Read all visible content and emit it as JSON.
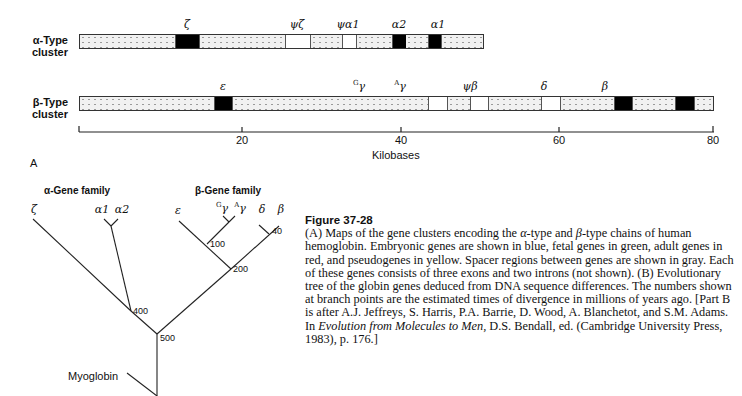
{
  "panel_a": {
    "label": "A",
    "alpha_cluster": {
      "label_line1": "α-Type",
      "label_line2": "cluster",
      "genes": [
        {
          "name": "ζ",
          "type": "gene",
          "x": 188
        },
        {
          "name": "ψζ",
          "type": "pseudogene",
          "x": 296
        },
        {
          "name": "ψα1",
          "type": "pseudogene",
          "x": 349
        },
        {
          "name": "α2",
          "type": "gene",
          "x": 399
        },
        {
          "name": "α1",
          "type": "gene",
          "x": 438
        }
      ]
    },
    "beta_cluster": {
      "label_line1": "β-Type",
      "label_line2": "cluster",
      "genes": [
        {
          "name": "ε",
          "type": "gene",
          "x": 223
        },
        {
          "name": "Gγ",
          "sup": "G",
          "base": "γ",
          "type": "fetal",
          "x": 358
        },
        {
          "name": "Aγ",
          "sup": "A",
          "base": "γ",
          "type": "fetal",
          "x": 400
        },
        {
          "name": "ψβ",
          "type": "pseudogene",
          "x": 470
        },
        {
          "name": "δ",
          "type": "gene",
          "x": 543
        },
        {
          "name": "β",
          "type": "gene",
          "x": 605
        }
      ]
    },
    "axis": {
      "title": "Kilobases",
      "ticks": [
        "20",
        "40",
        "60",
        "80"
      ],
      "range": [
        0,
        80
      ]
    }
  },
  "panel_b": {
    "alpha_family_title": "α-Gene family",
    "beta_family_title": "β-Gene family",
    "leaves": {
      "zeta": "ζ",
      "alpha1": "α1",
      "alpha2": "α2",
      "epsilon": "ε",
      "g_gamma_sup": "G",
      "a_gamma_sup": "A",
      "gamma": "γ",
      "delta": "δ",
      "beta": "β",
      "myoglobin": "Myoglobin"
    },
    "nodes": {
      "n100": "100",
      "n40": "40",
      "n200": "200",
      "n400": "400",
      "n500": "500"
    }
  },
  "caption": {
    "title": "Figure 37-28",
    "part1": "(A) Maps of the gene clusters encoding the ",
    "alpha": "α",
    "part2": "-type and ",
    "beta": "β",
    "part3": "-type chains of human hemoglobin. Embryonic genes are shown in blue, fetal genes in green, adult genes in red, and pseudogenes in yellow. Spacer regions between genes are shown in gray. Each of these genes consists of three exons and two introns (not shown). (B) Evolutionary tree of the globin genes deduced from DNA sequence differences. The numbers shown at branch points are the estimated times of divergence in millions of years ago. [Part B is after A.J. Jeffreys, S. Harris, P.A. Barrie, D. Wood, A. Blanchetot, and S.M. Adams. In ",
    "book": "Evolution from Molecules to Men,",
    "part4": " D.S. Bendall, ed. (Cambridge University Press, 1983), p. 176.]"
  }
}
